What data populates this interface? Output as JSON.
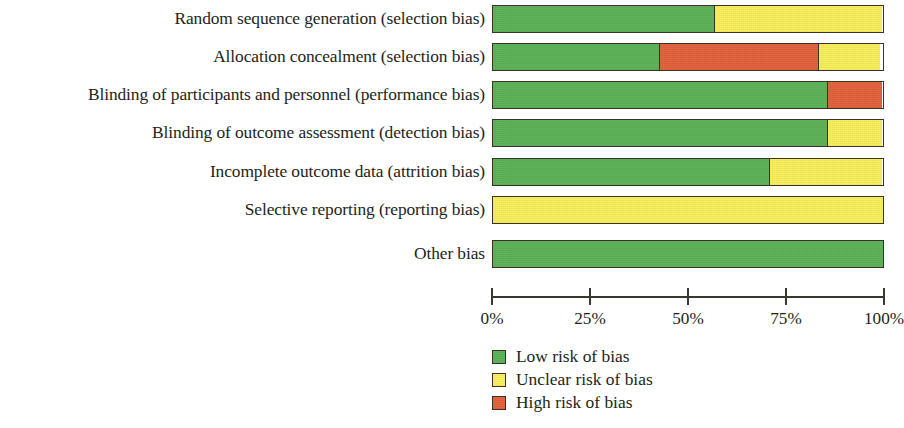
{
  "figure": {
    "type": "risk-of-bias-graph",
    "axis_label": "",
    "background_color": "#ffffff"
  },
  "colors": {
    "low": "#5cb257",
    "unclear": "#f8ee5c",
    "high": "#e2613c",
    "outline": "#3a3226",
    "text": "#231f20"
  },
  "axis": {
    "ticks": [
      {
        "label": "0%",
        "value": 0
      },
      {
        "label": "25%",
        "value": 25
      },
      {
        "label": "50%",
        "value": 50
      },
      {
        "label": "75%",
        "value": 75
      },
      {
        "label": "100%",
        "value": 100
      }
    ],
    "min": 0,
    "max": 100
  },
  "legend": {
    "items": [
      {
        "key": "low",
        "label": "Low risk of bias",
        "color": "#5cb257"
      },
      {
        "key": "unclear",
        "label": "Unclear risk of bias",
        "color": "#f8ee5c"
      },
      {
        "key": "high",
        "label": "High risk of bias",
        "color": "#e2613c"
      }
    ]
  },
  "rows": [
    {
      "label": "Random sequence generation (selection bias)",
      "segments": [
        {
          "key": "low",
          "value": 57
        },
        {
          "key": "unclear",
          "value": 43
        }
      ]
    },
    {
      "label": "Allocation concealment (selection bias)",
      "segments": [
        {
          "key": "low",
          "value": 43
        },
        {
          "key": "high",
          "value": 41
        },
        {
          "key": "unclear",
          "value": 16
        }
      ]
    },
    {
      "label": "Blinding of participants and personnel (performance bias)",
      "segments": [
        {
          "key": "low",
          "value": 86
        },
        {
          "key": "high",
          "value": 14
        }
      ]
    },
    {
      "label": "Blinding of outcome assessment (detection bias)",
      "segments": [
        {
          "key": "low",
          "value": 86
        },
        {
          "key": "unclear",
          "value": 14
        }
      ]
    },
    {
      "label": "Incomplete outcome data (attrition bias)",
      "segments": [
        {
          "key": "low",
          "value": 71
        },
        {
          "key": "unclear",
          "value": 29
        }
      ]
    },
    {
      "label": "Selective reporting (reporting bias)",
      "segments": [
        {
          "key": "unclear",
          "value": 100
        }
      ]
    },
    {
      "label": "Other bias",
      "segments": [
        {
          "key": "low",
          "value": 100
        }
      ]
    }
  ],
  "chart_data": {
    "type": "bar",
    "orientation": "horizontal",
    "stacked": true,
    "normalized_percent": true,
    "title": "",
    "subtitle": "",
    "xlabel": "",
    "ylabel": "",
    "xlim": [
      0,
      100
    ],
    "xticks": [
      0,
      25,
      50,
      75,
      100
    ],
    "xticklabels": [
      "0%",
      "25%",
      "50%",
      "75%",
      "100%"
    ],
    "grid": false,
    "legend_position": "bottom-center",
    "categories": [
      "Random sequence generation (selection bias)",
      "Allocation concealment (selection bias)",
      "Blinding of participants and personnel (performance bias)",
      "Blinding of outcome assessment (detection bias)",
      "Incomplete outcome data (attrition bias)",
      "Selective reporting (reporting bias)",
      "Other bias"
    ],
    "series": [
      {
        "name": "Low risk of bias",
        "color": "#5cb257",
        "values": [
          57,
          43,
          86,
          86,
          71,
          0,
          100
        ]
      },
      {
        "name": "Unclear risk of bias",
        "color": "#f8ee5c",
        "values": [
          43,
          16,
          0,
          14,
          29,
          100,
          0
        ]
      },
      {
        "name": "High risk of bias",
        "color": "#e2613c",
        "values": [
          0,
          41,
          14,
          0,
          0,
          0,
          0
        ]
      }
    ]
  }
}
